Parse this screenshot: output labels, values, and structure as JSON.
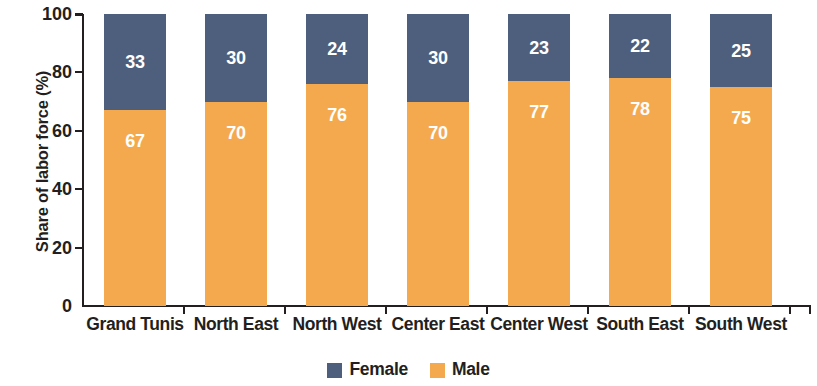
{
  "chart_data": {
    "type": "bar",
    "subtype": "stacked-100-percent",
    "title": "",
    "xlabel": "",
    "ylabel": "Share of labor force (%)",
    "ylim": [
      0,
      100
    ],
    "yticks": [
      0,
      20,
      40,
      60,
      80,
      100
    ],
    "ytick_labels": [
      "0",
      "20",
      "40",
      "60",
      "80",
      "100"
    ],
    "grid": false,
    "legend_position": "bottom-center",
    "categories": [
      "Grand Tunis",
      "North East",
      "North West",
      "Center East",
      "Center West",
      "South East",
      "South West"
    ],
    "series": [
      {
        "name": "Female",
        "color": "#4d5f7c",
        "values": [
          33,
          30,
          24,
          30,
          23,
          22,
          25
        ],
        "labels": [
          "33",
          "30",
          "24",
          "30",
          "23",
          "22",
          "25"
        ]
      },
      {
        "name": "Male",
        "color": "#f5a94e",
        "values": [
          67,
          70,
          76,
          70,
          77,
          78,
          75
        ],
        "labels": [
          "67",
          "70",
          "76",
          "70",
          "77",
          "78",
          "75"
        ]
      }
    ]
  },
  "legend": {
    "items": [
      {
        "label": "Female",
        "color": "#4d5f7c",
        "swatch_name": "legend-swatch-female"
      },
      {
        "label": "Male",
        "color": "#f5a94e",
        "swatch_name": "legend-swatch-male"
      }
    ]
  },
  "colors": {
    "female": "#4d5f7c",
    "male": "#f5a94e",
    "axis": "#231f20",
    "value_label": "#ffffff",
    "background": "#ffffff"
  }
}
